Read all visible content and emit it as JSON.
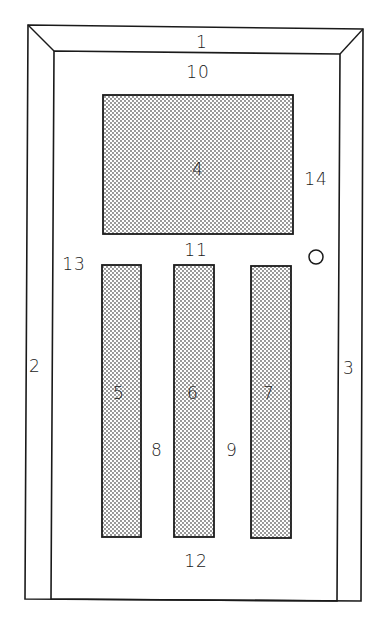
{
  "diagram": {
    "colors": {
      "line": "#1a1a1a",
      "stipple": "#6a6a6a",
      "background": "#ffffff"
    },
    "parts": [
      {
        "id": "1",
        "label": "1",
        "desc": "head jamb / top frame",
        "x": 202,
        "y": 42
      },
      {
        "id": "2",
        "label": "2",
        "desc": "left jamb",
        "x": 35,
        "y": 366
      },
      {
        "id": "3",
        "label": "3",
        "desc": "right jamb",
        "x": 349,
        "y": 368
      },
      {
        "id": "4",
        "label": "4",
        "desc": "upper panel",
        "x": 198,
        "y": 169
      },
      {
        "id": "5",
        "label": "5",
        "desc": "lower left panel",
        "x": 119,
        "y": 393
      },
      {
        "id": "6",
        "label": "6",
        "desc": "lower center panel",
        "x": 193,
        "y": 393
      },
      {
        "id": "7",
        "label": "7",
        "desc": "lower right panel",
        "x": 269,
        "y": 393
      },
      {
        "id": "8",
        "label": "8",
        "desc": "mullion",
        "x": 157,
        "y": 450
      },
      {
        "id": "9",
        "label": "9",
        "desc": "mullion",
        "x": 232,
        "y": 450
      },
      {
        "id": "10",
        "label": "10",
        "desc": "top rail",
        "x": 198,
        "y": 72
      },
      {
        "id": "11",
        "label": "11",
        "desc": "lock rail",
        "x": 196,
        "y": 250
      },
      {
        "id": "12",
        "label": "12",
        "desc": "bottom rail",
        "x": 196,
        "y": 561
      },
      {
        "id": "13",
        "label": "13",
        "desc": "hinge stile",
        "x": 74,
        "y": 264
      },
      {
        "id": "14",
        "label": "14",
        "desc": "lock stile",
        "x": 316,
        "y": 179
      }
    ],
    "knob": {
      "name": "door knob",
      "cx": 316,
      "cy": 257,
      "r": 7
    }
  }
}
